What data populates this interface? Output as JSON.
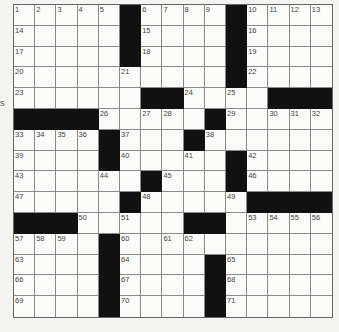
{
  "puzzle": {
    "rows": 15,
    "cols": 15,
    "layout": [
      "11111011110 1111",
      "placeholder"
    ],
    "grid": [
      ".....#....#....",
      ".....#....#....",
      ".....#....#....",
      "..........#....",
      "......##....###",
      "####.....#.....",
      "....#...#......",
      "....#.....#....",
      "......#...#....",
      ".....#.....####",
      "###.....##.....",
      "....#..........",
      "....#....#.....",
      "....#....#.....",
      "....#....#....."
    ],
    "numbers": [
      [
        1,
        2,
        3,
        4,
        5,
        0,
        6,
        7,
        8,
        9,
        0,
        10,
        11,
        12,
        13
      ],
      [
        14,
        0,
        0,
        0,
        0,
        0,
        15,
        0,
        0,
        0,
        0,
        16,
        0,
        0,
        0
      ],
      [
        17,
        0,
        0,
        0,
        0,
        0,
        18,
        0,
        0,
        0,
        0,
        19,
        0,
        0,
        0
      ],
      [
        20,
        0,
        0,
        0,
        0,
        21,
        0,
        0,
        0,
        0,
        0,
        22,
        0,
        0,
        0
      ],
      [
        23,
        0,
        0,
        0,
        0,
        0,
        0,
        0,
        24,
        0,
        25,
        0,
        0,
        0,
        0
      ],
      [
        0,
        0,
        0,
        0,
        26,
        0,
        27,
        28,
        0,
        0,
        29,
        0,
        30,
        31,
        32
      ],
      [
        33,
        34,
        35,
        36,
        0,
        37,
        0,
        0,
        0,
        38,
        0,
        0,
        0,
        0,
        0
      ],
      [
        39,
        0,
        0,
        0,
        0,
        40,
        0,
        0,
        41,
        0,
        0,
        42,
        0,
        0,
        0
      ],
      [
        43,
        0,
        0,
        0,
        44,
        0,
        0,
        45,
        0,
        0,
        0,
        46,
        0,
        0,
        0
      ],
      [
        47,
        0,
        0,
        0,
        0,
        0,
        48,
        0,
        0,
        0,
        49,
        0,
        0,
        0,
        0
      ],
      [
        0,
        0,
        0,
        50,
        0,
        51,
        0,
        0,
        0,
        52,
        0,
        53,
        54,
        55,
        56
      ],
      [
        57,
        58,
        59,
        0,
        0,
        60,
        0,
        61,
        62,
        0,
        0,
        0,
        0,
        0,
        0
      ],
      [
        63,
        0,
        0,
        0,
        0,
        64,
        0,
        0,
        0,
        0,
        65,
        0,
        0,
        0,
        0
      ],
      [
        66,
        0,
        0,
        0,
        0,
        67,
        0,
        0,
        0,
        0,
        68,
        0,
        0,
        0,
        0
      ],
      [
        69,
        0,
        0,
        0,
        0,
        70,
        0,
        0,
        0,
        0,
        71,
        0,
        0,
        0,
        0
      ]
    ]
  },
  "edge_text": "s",
  "colors": {
    "black_cell": "#111111",
    "white_cell": "#fbfbfa",
    "grid_line": "#8a8a8a"
  }
}
